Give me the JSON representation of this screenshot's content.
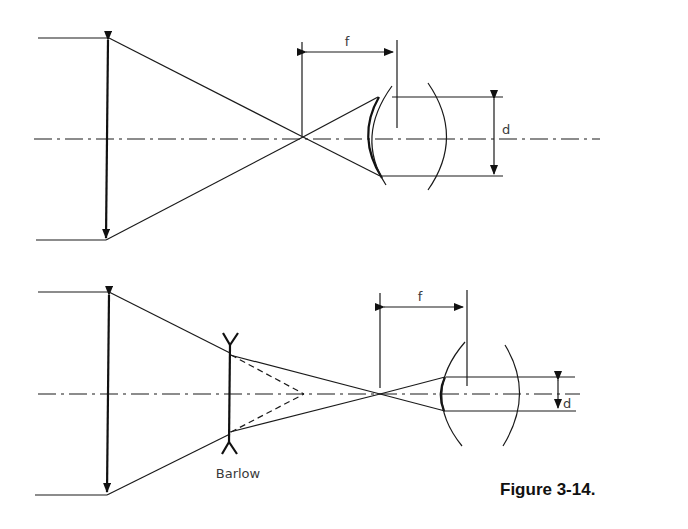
{
  "figure": {
    "caption": "Figure 3-14.",
    "top_diagram": {
      "focal_label": "f",
      "diameter_label": "d"
    },
    "bottom_diagram": {
      "focal_label": "f",
      "diameter_label": "d",
      "lens_label": "Barlow"
    },
    "colors": {
      "ink": "#1a1a1a",
      "background": "#ffffff"
    }
  }
}
